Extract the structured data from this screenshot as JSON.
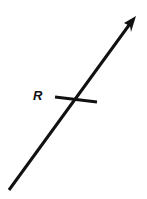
{
  "diagram": {
    "label": "R",
    "stroke_color": "#111111",
    "background": "#ffffff",
    "arrow": {
      "x1": 9,
      "y1": 190,
      "x2": 136,
      "y2": 16
    },
    "tick": {
      "x1": 55,
      "y1": 97,
      "x2": 97,
      "y2": 102
    }
  }
}
